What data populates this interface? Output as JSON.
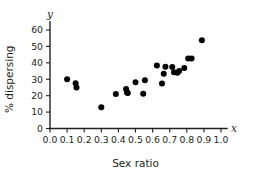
{
  "chart_data": {
    "type": "scatter",
    "title": "",
    "xlabel": "Sex ratio",
    "ylabel": "% dispersing",
    "x_var_symbol": "x",
    "y_var_symbol": "y",
    "xlim": [
      0.0,
      1.0
    ],
    "ylim": [
      0,
      65
    ],
    "xticks": [
      0.0,
      0.1,
      0.2,
      0.3,
      0.4,
      0.5,
      0.6,
      0.7,
      0.8,
      0.9,
      1.0
    ],
    "xticklabels": [
      "0.0",
      "0.1",
      "0.2",
      "0.3",
      "0.4",
      "0.5",
      "0.6",
      "0.7",
      "0.8",
      "0.9",
      "1.0"
    ],
    "yticks": [
      0,
      10,
      20,
      30,
      40,
      50,
      60
    ],
    "yticklabels": [
      "0",
      "10",
      "20",
      "30",
      "40",
      "50",
      "60"
    ],
    "grid": false,
    "legend": null,
    "marker": "filled-circle",
    "marker_color": "#000000",
    "points": [
      {
        "x": 0.1,
        "y": 30.0
      },
      {
        "x": 0.15,
        "y": 27.6
      },
      {
        "x": 0.155,
        "y": 25.0
      },
      {
        "x": 0.3,
        "y": 13.0
      },
      {
        "x": 0.385,
        "y": 21.0
      },
      {
        "x": 0.445,
        "y": 24.0
      },
      {
        "x": 0.45,
        "y": 22.0
      },
      {
        "x": 0.455,
        "y": 21.6
      },
      {
        "x": 0.5,
        "y": 28.2
      },
      {
        "x": 0.545,
        "y": 21.2
      },
      {
        "x": 0.555,
        "y": 29.4
      },
      {
        "x": 0.625,
        "y": 38.4
      },
      {
        "x": 0.655,
        "y": 27.4
      },
      {
        "x": 0.665,
        "y": 33.3
      },
      {
        "x": 0.675,
        "y": 37.6
      },
      {
        "x": 0.715,
        "y": 37.4
      },
      {
        "x": 0.725,
        "y": 34.2
      },
      {
        "x": 0.745,
        "y": 34.0
      },
      {
        "x": 0.755,
        "y": 35.0
      },
      {
        "x": 0.785,
        "y": 36.8
      },
      {
        "x": 0.808,
        "y": 42.6
      },
      {
        "x": 0.828,
        "y": 42.6
      },
      {
        "x": 0.888,
        "y": 53.8
      }
    ]
  }
}
